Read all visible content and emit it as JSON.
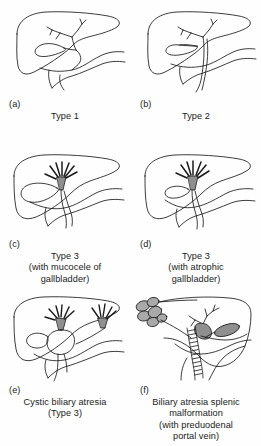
{
  "figure": {
    "background_color": "#fefefe",
    "line_color": "#1a1a1a",
    "fill_gray": "#a9a9a9",
    "fill_gray_dark": "#8f8f8f"
  },
  "panels": [
    {
      "id": "a",
      "label": "(a)",
      "caption_lines": [
        "Type 1"
      ],
      "structures": [
        "liver",
        "gallbladder",
        "cystic-duct",
        "common-bile-duct",
        "intrahepatic-ducts",
        "duodenum"
      ]
    },
    {
      "id": "b",
      "label": "(b)",
      "caption_lines": [
        "Type 2"
      ],
      "structures": [
        "liver",
        "gallbladder",
        "cystic-duct",
        "atretic-common-hepatic-duct",
        "intrahepatic-ducts",
        "duodenum"
      ]
    },
    {
      "id": "c",
      "label": "(c)",
      "caption_lines": [
        "Type 3",
        "(with mucocele of",
        "gallbladder)"
      ],
      "structures": [
        "liver",
        "distended-gallbladder",
        "fibrous-cone-porta-hepatis",
        "common-bile-duct",
        "duodenum"
      ]
    },
    {
      "id": "d",
      "label": "(d)",
      "caption_lines": [
        "Type 3",
        "(with atrophic",
        "gallbladder)"
      ],
      "structures": [
        "liver",
        "atrophic-gallbladder",
        "fibrous-cone-porta-hepatis",
        "common-bile-duct",
        "duodenum"
      ]
    },
    {
      "id": "e",
      "label": "(e)",
      "caption_lines": [
        "Cystic biliary atresia",
        "(Type 3)"
      ],
      "structures": [
        "liver",
        "gallbladder",
        "biliary-cyst",
        "fibrous-cone-porta-hepatis",
        "second-fibrous-cone",
        "duodenum"
      ]
    },
    {
      "id": "f",
      "label": "(f)",
      "caption_lines": [
        "Biliary atresia splenic",
        "malformation",
        "(with preduodenal",
        "portal vein)"
      ],
      "structures": [
        "liver",
        "polysplenia",
        "gallbladder",
        "preduodenal-portal-vein",
        "intrahepatic-ducts",
        "duodenum"
      ]
    }
  ]
}
